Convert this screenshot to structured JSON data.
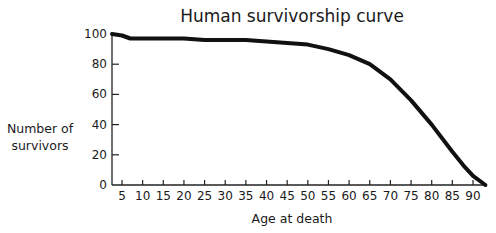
{
  "chart_data": {
    "type": "line",
    "title": "Human survivorship curve",
    "xlabel": "Age at death",
    "ylabel": "Number of survivors",
    "ylabel_lines": [
      "Number of",
      "survivors"
    ],
    "x_ticks": [
      5,
      10,
      15,
      20,
      25,
      30,
      35,
      40,
      45,
      50,
      55,
      60,
      65,
      70,
      75,
      80,
      85,
      90
    ],
    "y_ticks": [
      0,
      20,
      40,
      60,
      80,
      100
    ],
    "xlim": [
      2.5,
      93
    ],
    "ylim": [
      0,
      100
    ],
    "grid": false,
    "legend": null,
    "series": [
      {
        "name": "Survivors",
        "color": "#111111",
        "x": [
          2.5,
          5,
          7,
          10,
          15,
          20,
          25,
          30,
          35,
          40,
          45,
          50,
          55,
          60,
          65,
          70,
          75,
          80,
          85,
          88,
          90,
          93
        ],
        "values": [
          100,
          99,
          97,
          97,
          97,
          97,
          96,
          96,
          96,
          95,
          94,
          93,
          90,
          86,
          80,
          70,
          56,
          40,
          22,
          12,
          6,
          0
        ]
      }
    ]
  }
}
